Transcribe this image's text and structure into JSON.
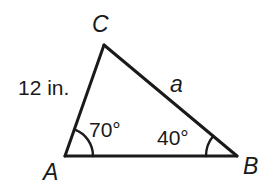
{
  "figure": {
    "type": "triangle-diagram",
    "background_color": "#ffffff",
    "stroke_color": "#1a1a1a",
    "vertices": {
      "A": {
        "label": "A",
        "x": 65,
        "y": 156
      },
      "B": {
        "label": "B",
        "x": 237,
        "y": 156
      },
      "C": {
        "label": "C",
        "x": 104,
        "y": 45
      }
    },
    "sides": {
      "AC": {
        "label": "12 in.",
        "value": "12",
        "unit": "in."
      },
      "CB": {
        "label": "a"
      },
      "AB": {
        "label": ""
      }
    },
    "angles": {
      "at_A": {
        "label": "70°",
        "value": 70,
        "unit": "degrees",
        "arc": true
      },
      "at_B": {
        "label": "40°",
        "value": 40,
        "unit": "degrees",
        "arc": true
      },
      "at_C": {
        "label": "",
        "value": 70,
        "unit": "degrees",
        "arc": false
      }
    }
  }
}
